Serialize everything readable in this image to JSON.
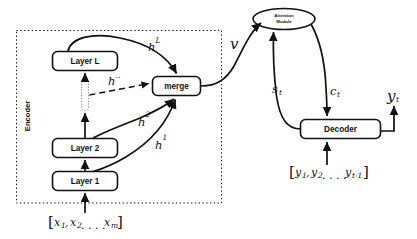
{
  "diagram": {
    "colors": {
      "stroke": "#111111",
      "background": "#ffffff",
      "dashed": "#111111"
    },
    "encoder": {
      "group_label": "Encoder",
      "boxes": [
        {
          "id": "layer-l",
          "label": "Layer L"
        },
        {
          "id": "layer-2",
          "label": "Layer 2"
        },
        {
          "id": "layer-1",
          "label": "Layer 1"
        }
      ],
      "ellipsis_placeholder": "",
      "merge_label": "merge",
      "input_sequence": "[x₁, x₂ . . . . xₘ]",
      "input_parts": {
        "open": "[",
        "x1_base": "x",
        "x1_sub": "1",
        "x2_base": "x",
        "x2_sub": "2",
        "dots": ". . . .",
        "xm_base": "x",
        "xm_sub": "m",
        "close": "]"
      }
    },
    "attention": {
      "label_line1": "Attention",
      "label_line2": "Module"
    },
    "decoder": {
      "label": "Decoder",
      "input_sequence": "[y₁, y₂ . . . . yₜ₋₁]",
      "input_parts": {
        "open": "[",
        "y1_base": "y",
        "y1_sub": "1",
        "y2_base": "y",
        "y2_sub": "2",
        "dots": ". . . .",
        "yt_base": "y",
        "yt_sub": "t-1",
        "close": "]"
      }
    },
    "edge_labels": {
      "h_L": {
        "base": "h",
        "sup": "L"
      },
      "h_dots": {
        "base": "h",
        "sup": ".."
      },
      "h_2": {
        "base": "h",
        "sup": "2"
      },
      "h_1": {
        "base": "h",
        "sup": "1"
      },
      "v": {
        "base": "v",
        "sup": ""
      },
      "s_t": {
        "base": "s",
        "sub": "t"
      },
      "c_t": {
        "base": "c",
        "sub": "t"
      },
      "y_t": {
        "base": "y",
        "sub": "t"
      }
    }
  }
}
